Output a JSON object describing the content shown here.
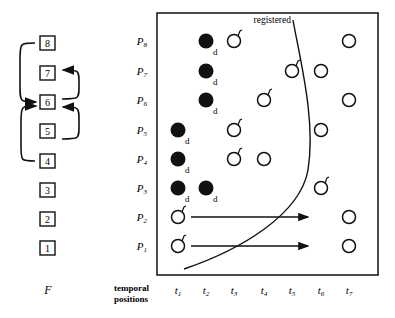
{
  "left_panel": {
    "title": "F",
    "boxes": [
      {
        "label": "8",
        "y": 43
      },
      {
        "label": "7",
        "y": 73
      },
      {
        "label": "6",
        "y": 102
      },
      {
        "label": "5",
        "y": 131
      },
      {
        "label": "4",
        "y": 161
      },
      {
        "label": "3",
        "y": 190
      },
      {
        "label": "2",
        "y": 219
      },
      {
        "label": "1",
        "y": 248
      }
    ],
    "links": [
      {
        "from": "8",
        "to": "6",
        "side": "left"
      },
      {
        "from": "6",
        "to": "7",
        "side": "right"
      },
      {
        "from": "4",
        "to": "6",
        "side": "left"
      },
      {
        "from": "5",
        "to": "6",
        "side": "right"
      }
    ]
  },
  "grid": {
    "rows": [
      {
        "label": "P8",
        "base": "P",
        "sub": "8",
        "y": 41
      },
      {
        "label": "P7",
        "base": "P",
        "sub": "7",
        "y": 71
      },
      {
        "label": "P6",
        "base": "P",
        "sub": "6",
        "y": 100
      },
      {
        "label": "P5",
        "base": "P",
        "sub": "5",
        "y": 130
      },
      {
        "label": "P4",
        "base": "P",
        "sub": "4",
        "y": 159
      },
      {
        "label": "P3",
        "base": "P",
        "sub": "3",
        "y": 188
      },
      {
        "label": "P2",
        "base": "P",
        "sub": "2",
        "y": 217
      },
      {
        "label": "P1",
        "base": "P",
        "sub": "1",
        "y": 246
      }
    ],
    "columns": [
      {
        "label": "t1",
        "base": "t",
        "sub": "1",
        "x": 178
      },
      {
        "label": "t2",
        "base": "t",
        "sub": "2",
        "x": 206
      },
      {
        "label": "t3",
        "base": "t",
        "sub": "3",
        "x": 234
      },
      {
        "label": "t4",
        "base": "t",
        "sub": "4",
        "x": 264
      },
      {
        "label": "t5",
        "base": "t",
        "sub": "5",
        "x": 292
      },
      {
        "label": "t6",
        "base": "t",
        "sub": "6",
        "x": 321
      },
      {
        "label": "t7",
        "base": "t",
        "sub": "7",
        "x": 349
      }
    ],
    "axis_label_line1": "temporal",
    "axis_label_line2": "positions",
    "curve_label": "registered",
    "filled_marker_label": "d",
    "open_marker_flag_label": "f",
    "points": [
      {
        "row": "P8",
        "col": "t2",
        "type": "filled",
        "tag": "d"
      },
      {
        "row": "P8",
        "col": "t3",
        "type": "open",
        "tag": "f"
      },
      {
        "row": "P8",
        "col": "t7",
        "type": "open",
        "tag": ""
      },
      {
        "row": "P7",
        "col": "t2",
        "type": "filled",
        "tag": "d"
      },
      {
        "row": "P7",
        "col": "t5",
        "type": "open",
        "tag": "f"
      },
      {
        "row": "P7",
        "col": "t6",
        "type": "open",
        "tag": ""
      },
      {
        "row": "P6",
        "col": "t2",
        "type": "filled",
        "tag": "d"
      },
      {
        "row": "P6",
        "col": "t4",
        "type": "open",
        "tag": "f"
      },
      {
        "row": "P6",
        "col": "t7",
        "type": "open",
        "tag": ""
      },
      {
        "row": "P5",
        "col": "t1",
        "type": "filled",
        "tag": "d"
      },
      {
        "row": "P5",
        "col": "t3",
        "type": "open",
        "tag": "f"
      },
      {
        "row": "P5",
        "col": "t6",
        "type": "open",
        "tag": ""
      },
      {
        "row": "P4",
        "col": "t1",
        "type": "filled",
        "tag": "d"
      },
      {
        "row": "P4",
        "col": "t3",
        "type": "open",
        "tag": "f"
      },
      {
        "row": "P4",
        "col": "t4",
        "type": "open",
        "tag": ""
      },
      {
        "row": "P3",
        "col": "t1",
        "type": "filled",
        "tag": "d"
      },
      {
        "row": "P3",
        "col": "t2",
        "type": "filled",
        "tag": "d"
      },
      {
        "row": "P3",
        "col": "t6",
        "type": "open",
        "tag": "f"
      },
      {
        "row": "P2",
        "col": "t1",
        "type": "open",
        "tag": "f"
      },
      {
        "row": "P2",
        "col": "t7",
        "type": "open",
        "tag": ""
      },
      {
        "row": "P1",
        "col": "t1",
        "type": "open",
        "tag": "f"
      },
      {
        "row": "P1",
        "col": "t7",
        "type": "open",
        "tag": ""
      }
    ],
    "arrows": [
      {
        "row": "P2",
        "x_start": 191,
        "x_end": 308
      },
      {
        "row": "P1",
        "x_start": 191,
        "x_end": 308
      }
    ]
  },
  "colors": {
    "ink": "#111111",
    "background": "#ffffff"
  }
}
